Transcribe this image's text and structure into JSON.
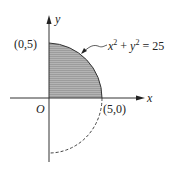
{
  "diagram": {
    "equation": "x² + y² = 25",
    "eq_x": "x",
    "eq_y": "y",
    "eq_rhs": " = 25",
    "eq_plus": " + ",
    "point_top": "(0,5)",
    "point_right": "(5,0)",
    "origin_label": "O",
    "x_axis_label": "x",
    "y_axis_label": "y",
    "shaded_region": "quarter disk in first quadrant",
    "dashed_arc": "lower-right quarter circle (fourth quadrant)",
    "colors": {
      "shade": "#a9a9a9",
      "line": "#333333"
    }
  }
}
